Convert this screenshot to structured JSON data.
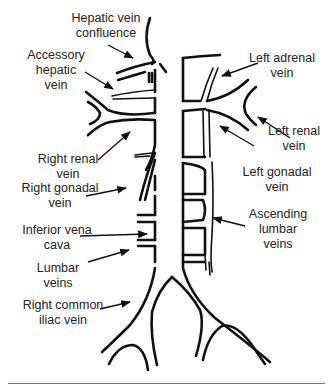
{
  "diagram": {
    "labels": {
      "hepatic_vein_confluence": "Hepatic vein\nconfluence",
      "accessory_hepatic_vein": "Accessory\nhepatic\nvein",
      "right_renal_vein": "Right renal\nvein",
      "right_gonadal_vein": "Right gonadal\nvein",
      "inferior_vena_cava": "Inferior vena\ncava",
      "lumbar_veins": "Lumbar\nveins",
      "right_common_iliac_vein": "Right common\niliac vein",
      "left_adrenal_vein": "Left adrenal\nvein",
      "left_renal_vein": "Left renal\nvein",
      "left_gonadal_vein": "Left gonadal\nvein",
      "ascending_lumbar_veins": "Ascending\nlumbar\nveins"
    },
    "colors": {
      "line": "#111111",
      "text": "#222222",
      "background": "#ffffff"
    }
  }
}
